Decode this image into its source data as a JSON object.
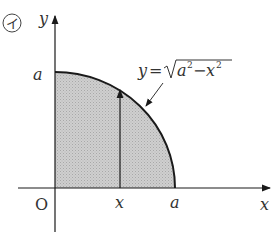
{
  "diagram": {
    "problem_marker": "イ",
    "axes": {
      "x_label": "x",
      "y_label": "y",
      "origin_label": "O"
    },
    "ticks": {
      "y_a": "a",
      "x_x": "x",
      "x_a": "a"
    },
    "curve_label": {
      "lhs": "y",
      "eq": "=",
      "radicand_a": "a",
      "exp_a": "2",
      "minus": "−",
      "radicand_x": "x",
      "exp_x": "2"
    },
    "colors": {
      "fill": "#c8c8c8",
      "stroke": "#1a1a1a"
    }
  }
}
